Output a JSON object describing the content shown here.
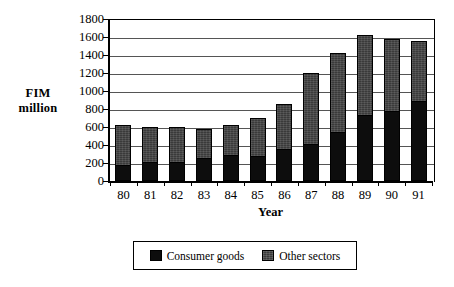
{
  "chart_data": {
    "type": "bar",
    "subtype": "stacked-vertical",
    "title": "",
    "xlabel": "Year",
    "ylabel": "FIM million",
    "ylabel_lines": [
      "FIM",
      "million"
    ],
    "ylim": [
      0,
      1800
    ],
    "ytick_step": 200,
    "ytick_labels": [
      "0",
      "200",
      "400",
      "600",
      "800",
      "1000",
      "1200",
      "1400",
      "1600",
      "1800"
    ],
    "ytick_values": [
      0,
      200,
      400,
      600,
      800,
      1000,
      1200,
      1400,
      1600,
      1800
    ],
    "grid": true,
    "grid_axis": "y",
    "legend_position": "bottom",
    "categories": [
      "80",
      "81",
      "82",
      "83",
      "84",
      "85",
      "86",
      "87",
      "88",
      "89",
      "90",
      "91"
    ],
    "series": [
      {
        "name": "Consumer goods",
        "color": "#0d0d0d",
        "values": [
          170,
          205,
          205,
          255,
          290,
          270,
          355,
          410,
          540,
          735,
          780,
          890
        ]
      },
      {
        "name": "Other sectors",
        "color": "#3a3a3a",
        "values": [
          450,
          395,
          390,
          325,
          330,
          430,
          500,
          790,
          880,
          890,
          795,
          670
        ]
      }
    ],
    "totals": [
      620,
      600,
      595,
      580,
      620,
      700,
      855,
      1200,
      1420,
      1625,
      1575,
      1560
    ]
  },
  "axis": {
    "y_title_line1": "FIM",
    "y_title_line2": "million",
    "x_title": "Year"
  },
  "legend": {
    "items": [
      {
        "label": "Consumer goods",
        "swatch": "consumer"
      },
      {
        "label": "Other sectors",
        "swatch": "other"
      }
    ]
  }
}
